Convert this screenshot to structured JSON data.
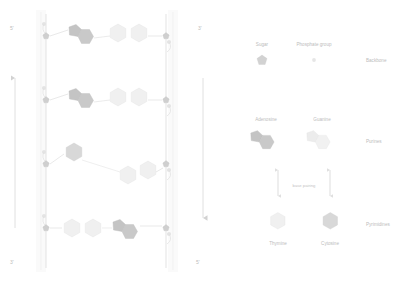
{
  "diagram": {
    "strand_labels": {
      "top_left": "5'",
      "top_right": "3'",
      "bottom_left": "3'",
      "bottom_right": "5'"
    },
    "direction_arrows": [
      {
        "name": "left-strand-direction",
        "orientation": "up"
      },
      {
        "name": "right-strand-direction",
        "orientation": "down"
      }
    ],
    "rungs": [
      {
        "index": 1,
        "left_base": "Adenosine",
        "right_base": "Thymine",
        "left_tone": "dark",
        "right_tone": "light"
      },
      {
        "index": 2,
        "left_base": "Adenosine",
        "right_base": "Thymine",
        "left_tone": "dark",
        "right_tone": "light"
      },
      {
        "index": 3,
        "left_base": "Guanine",
        "right_base": "Cytosine",
        "left_tone": "mid",
        "right_tone": "light"
      },
      {
        "index": 4,
        "left_base": "Thymine",
        "right_base": "Adenosine",
        "left_tone": "light",
        "right_tone": "dark"
      }
    ]
  },
  "legend": {
    "sugar": {
      "label": "Sugar",
      "icon": "pentagon-icon"
    },
    "phosphate": {
      "label": "Phosphate group",
      "icon": "circle-icon"
    },
    "backbone": {
      "label": "Backbone"
    },
    "purines": {
      "group_label": "Purines",
      "items": [
        {
          "label": "Adenosine",
          "icon": "fused-ring-icon",
          "tone": "dark"
        },
        {
          "label": "Guanine",
          "icon": "fused-ring-icon",
          "tone": "light"
        }
      ]
    },
    "base_pairing": {
      "label": "base pairing"
    },
    "pyrimidines": {
      "group_label": "Pyrimidines",
      "items": [
        {
          "label": "Thymine",
          "icon": "hexagon-icon",
          "tone": "light"
        },
        {
          "label": "Cytosine",
          "icon": "hexagon-icon",
          "tone": "mid"
        }
      ]
    }
  },
  "colors": {
    "dark_base": "#c9c9c9",
    "mid_base": "#d6d6d6",
    "light_base": "#efefef",
    "sugar": "#cfcfcf",
    "phosphate": "#e2e2e2",
    "backbone_line": "#dcdcdc",
    "text": "#bcbcbc"
  }
}
